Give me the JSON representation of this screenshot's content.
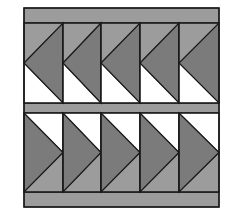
{
  "diagram": {
    "title": "",
    "type": "flying-geese-quilt-block",
    "colors": {
      "background": "#ffffff",
      "border_band": "#9c9c9c",
      "goose_dark": "#7b7b7b",
      "sky_light": "#9c9c9c",
      "sky_white": "#ffffff",
      "line": "#1a1a1a"
    },
    "frame": {
      "x": 24,
      "y": 8,
      "width": 195,
      "height": 199
    },
    "bands": [
      {
        "name": "top-band",
        "y": 8,
        "height": 15
      },
      {
        "name": "middle-band",
        "y": 103,
        "height": 10
      },
      {
        "name": "bottom-band",
        "y": 192,
        "height": 15
      }
    ],
    "columns": [
      24,
      63,
      101,
      140,
      179,
      219
    ],
    "rows": [
      {
        "name": "top-row",
        "y": 23,
        "height": 80,
        "direction": "left",
        "upper_corner": "light",
        "lower_corner": "white"
      },
      {
        "name": "bottom-row",
        "y": 113,
        "height": 79,
        "direction": "right",
        "upper_corner": "white",
        "lower_corner": "light"
      }
    ]
  }
}
